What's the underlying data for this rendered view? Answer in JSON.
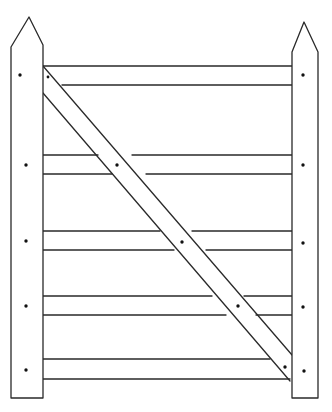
{
  "figure": {
    "width": 332,
    "height": 412,
    "stroke_color": "#2a2a2a",
    "background": "#ffffff",
    "posts": [
      {
        "name": "hanging-post-left",
        "x1": 11,
        "x2": 43,
        "apex": [
          29,
          17
        ],
        "shoulder_y": 47,
        "bottom_y": 398
      },
      {
        "name": "latch-post-right",
        "x1": 292,
        "x2": 318,
        "apex": [
          304,
          22
        ],
        "shoulder_y": 52,
        "bottom_y": 398
      }
    ],
    "rails": [
      {
        "top": 66,
        "bottom": 85
      },
      {
        "top": 155,
        "bottom": 174
      },
      {
        "top": 231,
        "bottom": 250
      },
      {
        "top": 296,
        "bottom": 315
      },
      {
        "top": 359,
        "bottom": 379
      }
    ],
    "brace": {
      "from": "top-left",
      "to": "bottom-right"
    },
    "nail_count": 16
  }
}
